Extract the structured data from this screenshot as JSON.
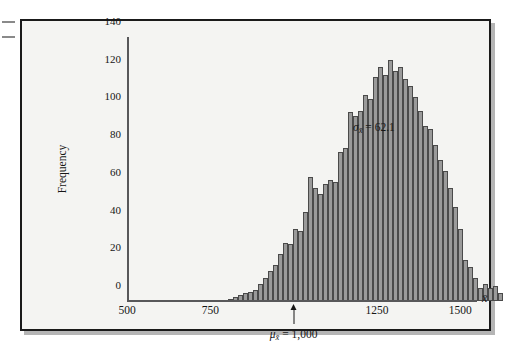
{
  "figure": {
    "kind": "histogram-figure",
    "background_color": "#f4f4f2",
    "frame_color": "#1a1a1a"
  },
  "annotations": {
    "sigma_label": "σ",
    "sigma_sub": "x̄",
    "sigma_text": "= 62.1",
    "sigma_value": 62.1,
    "mu_label": "μ",
    "mu_sub": "x̄",
    "mu_text": "= 1,000",
    "mu_value": 1000
  },
  "chart_data": {
    "type": "bar",
    "title": "",
    "subtitle": "",
    "xlabel": "x̄",
    "ylabel": "Frequency",
    "xlim": [
      500,
      1550
    ],
    "ylim": [
      0,
      140
    ],
    "grid": false,
    "legend": null,
    "bar_color": "#9a9a9a",
    "bar_edge_color": "#4a4a4a",
    "x_ticks": [
      500,
      750,
      1250,
      1500
    ],
    "x_tick_labels": [
      "500",
      "750",
      "1250",
      "1500"
    ],
    "y_ticks": [
      0,
      20,
      40,
      60,
      80,
      100,
      120,
      140
    ],
    "y_tick_labels": [
      "0",
      "20",
      "40",
      "60",
      "80",
      "100",
      "120",
      "140"
    ],
    "bin_width": 15,
    "x": [
      800,
      815,
      830,
      845,
      860,
      875,
      890,
      905,
      920,
      935,
      950,
      965,
      980,
      995,
      1010,
      1025,
      1040,
      1055,
      1070,
      1085,
      1100,
      1115,
      1130,
      1145,
      1160,
      1175,
      1190,
      1205,
      1220,
      1235,
      1250,
      1265
    ],
    "categories": [
      "800",
      "815",
      "830",
      "845",
      "860",
      "875",
      "890",
      "905",
      "920",
      "935",
      "950",
      "965",
      "980",
      "995",
      "1010",
      "1025",
      "1040",
      "1055",
      "1070",
      "1085",
      "1100",
      "1115",
      "1130",
      "1145",
      "1160",
      "1175",
      "1190",
      "1205",
      "1220",
      "1235",
      "1250",
      "1265"
    ],
    "values": [
      2,
      4,
      5,
      7,
      9,
      13,
      20,
      29,
      38,
      66,
      60,
      55,
      62,
      79,
      81,
      100,
      110,
      107,
      124,
      128,
      122,
      118,
      124,
      108,
      101,
      91,
      83,
      69,
      60,
      50,
      51,
      38
    ],
    "series": [
      {
        "name": "Sample mean frequency",
        "values": [
          2,
          4,
          5,
          7,
          9,
          13,
          20,
          29,
          38,
          66,
          60,
          55,
          62,
          79,
          81,
          100,
          110,
          107,
          124,
          128,
          122,
          118,
          124,
          108,
          101,
          91,
          83,
          69,
          60,
          50,
          51,
          38
        ]
      }
    ],
    "bars": [
      {
        "x": 803,
        "h": 1
      },
      {
        "x": 818,
        "h": 2
      },
      {
        "x": 833,
        "h": 3
      },
      {
        "x": 848,
        "h": 4
      },
      {
        "x": 863,
        "h": 5
      },
      {
        "x": 878,
        "h": 6
      },
      {
        "x": 893,
        "h": 9
      },
      {
        "x": 908,
        "h": 12
      },
      {
        "x": 923,
        "h": 16
      },
      {
        "x": 938,
        "h": 19
      },
      {
        "x": 953,
        "h": 25
      },
      {
        "x": 968,
        "h": 31
      },
      {
        "x": 983,
        "h": 30
      },
      {
        "x": 998,
        "h": 38
      },
      {
        "x": 1013,
        "h": 37
      },
      {
        "x": 1028,
        "h": 47
      },
      {
        "x": 1043,
        "h": 66
      },
      {
        "x": 1058,
        "h": 60
      },
      {
        "x": 1073,
        "h": 57
      },
      {
        "x": 1088,
        "h": 62
      },
      {
        "x": 1103,
        "h": 64
      },
      {
        "x": 1118,
        "h": 63
      },
      {
        "x": 1133,
        "h": 79
      },
      {
        "x": 1148,
        "h": 81
      },
      {
        "x": 1163,
        "h": 100
      },
      {
        "x": 1178,
        "h": 98
      },
      {
        "x": 1193,
        "h": 101
      },
      {
        "x": 1208,
        "h": 109
      },
      {
        "x": 1223,
        "h": 107
      },
      {
        "x": 1238,
        "h": 119
      },
      {
        "x": 1253,
        "h": 124
      },
      {
        "x": 1268,
        "h": 120
      },
      {
        "x": 1283,
        "h": 128
      },
      {
        "x": 1298,
        "h": 122
      },
      {
        "x": 1313,
        "h": 124
      },
      {
        "x": 1328,
        "h": 118
      },
      {
        "x": 1343,
        "h": 114
      },
      {
        "x": 1358,
        "h": 108
      },
      {
        "x": 1373,
        "h": 101
      },
      {
        "x": 1388,
        "h": 93
      },
      {
        "x": 1403,
        "h": 91
      },
      {
        "x": 1418,
        "h": 83
      },
      {
        "x": 1433,
        "h": 75
      },
      {
        "x": 1448,
        "h": 69
      },
      {
        "x": 1463,
        "h": 60
      },
      {
        "x": 1478,
        "h": 50
      },
      {
        "x": 1493,
        "h": 38
      },
      {
        "x": 1508,
        "h": 22
      },
      {
        "x": 1523,
        "h": 18
      },
      {
        "x": 1538,
        "h": 12
      },
      {
        "x": 1553,
        "h": 7
      },
      {
        "x": 1568,
        "h": 9
      },
      {
        "x": 1583,
        "h": 7
      },
      {
        "x": 1598,
        "h": 8
      },
      {
        "x": 1613,
        "h": 4
      }
    ]
  }
}
